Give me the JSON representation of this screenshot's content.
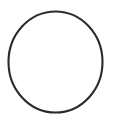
{
  "canvas": {
    "width": 113,
    "height": 123,
    "background_color": "#ffffff",
    "title": "Circle Outline",
    "description": "A single unfilled dark circle outline centered on a plain white background."
  },
  "shapes": [
    {
      "name": "circle-outline",
      "kind": "ellipse",
      "center_x": 55.5,
      "center_y": 62.0,
      "radius_x": 47.0,
      "radius_y": 50.5,
      "stroke_color": "#2b2b2d",
      "stroke_width": 2.1,
      "fill": "none",
      "bounds": {
        "left": 8,
        "top": 11,
        "right": 103,
        "bottom": 113
      }
    }
  ],
  "palette": {
    "stroke": "#2b2b2d",
    "stroke_light": "#3a3a3c",
    "background": "#ffffff"
  }
}
